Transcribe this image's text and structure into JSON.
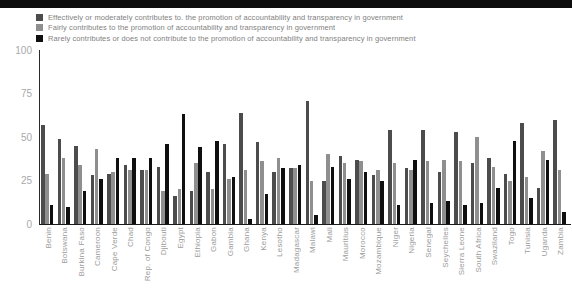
{
  "banner_color": "#0d0d0d",
  "chart_data": {
    "type": "bar",
    "title": "",
    "xlabel": "",
    "ylabel": "",
    "ylim": [
      0,
      100
    ],
    "yticks": [
      0,
      25,
      50,
      75,
      100
    ],
    "grid": false,
    "legend_position": "top-left",
    "categories": [
      "Benin",
      "Botswana",
      "Burkina Faso",
      "Cameroon",
      "Cape Verde",
      "Chad",
      "Rep. of Congo",
      "Djibouti",
      "Egypt",
      "Ethiopia",
      "Gabon",
      "Gambia",
      "Ghana",
      "Kenya",
      "Lesotho",
      "Madagascar",
      "Malawi",
      "Mali",
      "Mauritius",
      "Morocco",
      "Mozambique",
      "Niger",
      "Nigeria",
      "Senegal",
      "Seychelles",
      "Sierra Leone",
      "South Africa",
      "Swaziland",
      "Togo",
      "Tunisia",
      "Uganda",
      "Zambia"
    ],
    "series": [
      {
        "name": "Effectively or moderately contributes to. the promotion of accountability and transparency in government",
        "color": "#4c4c4c",
        "values": [
          57,
          49,
          45,
          28,
          29,
          34,
          31,
          33,
          16,
          19,
          30,
          46,
          64,
          47,
          30,
          32,
          71,
          25,
          39,
          37,
          28,
          54,
          32,
          54,
          30,
          53,
          35,
          38,
          29,
          58,
          21,
          60
        ]
      },
      {
        "name": "Fairly contributes to the promotion of accountability and transparency in government",
        "color": "#8f8f8f",
        "values": [
          29,
          38,
          34,
          43,
          30,
          31,
          31,
          19,
          20,
          35,
          20,
          26,
          31,
          36,
          38,
          32,
          25,
          40,
          35,
          36,
          31,
          35,
          31,
          36,
          37,
          36,
          50,
          33,
          25,
          27,
          42,
          31
        ]
      },
      {
        "name": "Rarely contributes or does not contribute to the promotion of accountability and transparency in government",
        "color": "#0f0f0f",
        "values": [
          11,
          10,
          19,
          26,
          38,
          38,
          38,
          46,
          63,
          44,
          48,
          27,
          3,
          17,
          32,
          34,
          5,
          33,
          26,
          30,
          25,
          11,
          37,
          12,
          13,
          11,
          12,
          21,
          48,
          15,
          37,
          7
        ]
      }
    ]
  }
}
